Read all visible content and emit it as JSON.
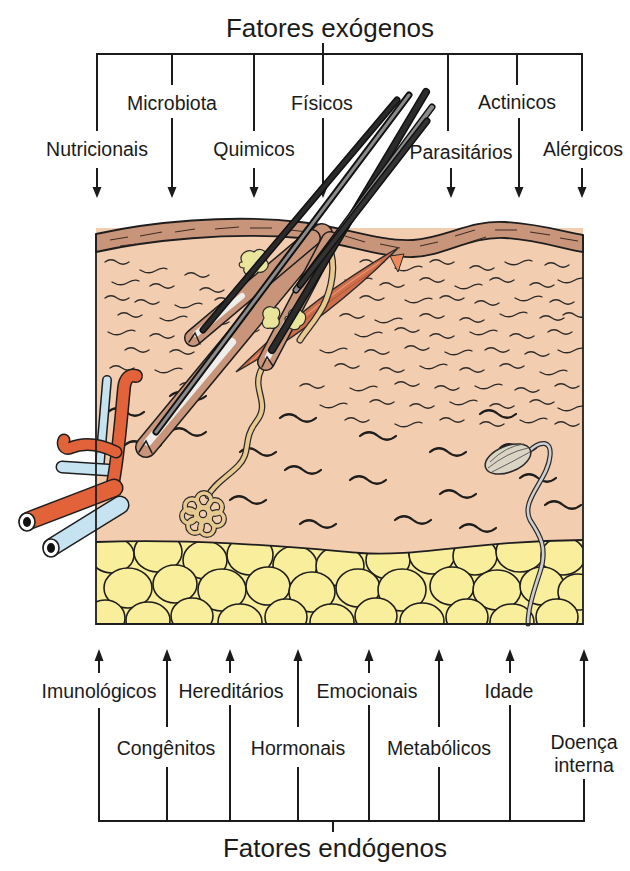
{
  "diagram": {
    "title_exogenous": "Fatores exógenos",
    "title_endogenous": "Fatores endógenos",
    "exogenous_factors": [
      {
        "label": "Nutricionais"
      },
      {
        "label": "Microbiota"
      },
      {
        "label": "Quimicos"
      },
      {
        "label": "Físicos"
      },
      {
        "label": "Parasitários"
      },
      {
        "label": "Actinicos"
      },
      {
        "label": "Alérgicos"
      }
    ],
    "endogenous_factors": [
      {
        "label": "Imunológicos"
      },
      {
        "label": "Congênitos"
      },
      {
        "label": "Hereditários"
      },
      {
        "label": "Hormonais"
      },
      {
        "label": "Emocionais"
      },
      {
        "label": "Metabólicos"
      },
      {
        "label": "Idade"
      },
      {
        "label": "Doença interna",
        "lines": [
          "Doença",
          "interna"
        ]
      }
    ]
  },
  "colors": {
    "epidermis": "#c8957a",
    "dermis": "#f3cdb0",
    "subcutaneous_fat": "#f8ee9b",
    "artery": "#e2623a",
    "vein": "#c6e3f1",
    "sebaceous_gland": "#e9e59a",
    "arrector_pili": "#cf6e4a",
    "lines": "#1b1b1b"
  }
}
